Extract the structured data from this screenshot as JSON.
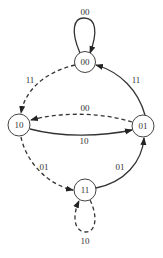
{
  "diagram": {
    "type": "state-transition",
    "nodes": [
      {
        "id": "00",
        "label": "00",
        "x": 85,
        "y": 62
      },
      {
        "id": "10",
        "label": "10",
        "x": 19,
        "y": 125
      },
      {
        "id": "01",
        "label": "01",
        "x": 143,
        "y": 126
      },
      {
        "id": "11",
        "label": "11",
        "x": 85,
        "y": 190
      }
    ],
    "edges": [
      {
        "from": "00",
        "to": "00",
        "label": "00",
        "style": "solid"
      },
      {
        "from": "00",
        "to": "10",
        "label": "11",
        "style": "dashed"
      },
      {
        "from": "01",
        "to": "00",
        "label": "11",
        "style": "solid"
      },
      {
        "from": "01",
        "to": "10",
        "label": "00",
        "style": "dashed"
      },
      {
        "from": "10",
        "to": "01",
        "label": "10",
        "style": "solid"
      },
      {
        "from": "10",
        "to": "11",
        "label": "01",
        "style": "dashed"
      },
      {
        "from": "11",
        "to": "01",
        "label": "01",
        "style": "solid"
      },
      {
        "from": "11",
        "to": "11",
        "label": "10",
        "style": "dashed"
      }
    ]
  }
}
